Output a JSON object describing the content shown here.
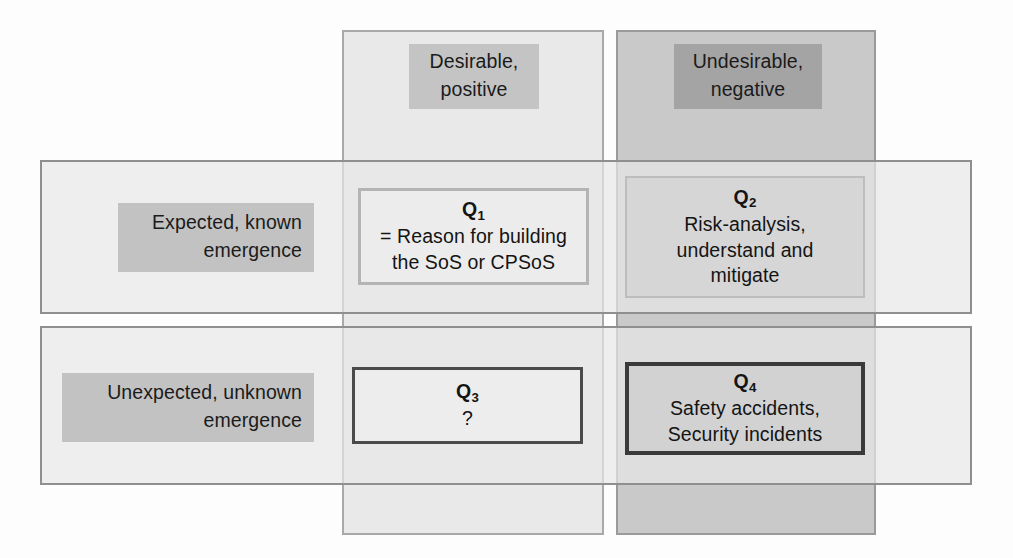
{
  "diagram": {
    "columns": [
      {
        "id": "positive",
        "line1": "Desirable,",
        "line2": "positive"
      },
      {
        "id": "negative",
        "line1": "Undesirable,",
        "line2": "negative"
      }
    ],
    "rows": [
      {
        "id": "expected",
        "line1": "Expected, known",
        "line2": "emergence"
      },
      {
        "id": "unexpected",
        "line1": "Unexpected, unknown",
        "line2": "emergence"
      }
    ],
    "quadrants": [
      {
        "id": "q1",
        "label": "Q",
        "index": "1",
        "lines": [
          "= Reason for building",
          "the SoS or CPSoS"
        ]
      },
      {
        "id": "q2",
        "label": "Q",
        "index": "2",
        "lines": [
          "Risk-analysis,",
          "understand and",
          "mitigate"
        ]
      },
      {
        "id": "q3",
        "label": "Q",
        "index": "3",
        "lines": [
          "?"
        ]
      },
      {
        "id": "q4",
        "label": "Q",
        "index": "4",
        "lines": [
          "Safety accidents,",
          "Security incidents"
        ]
      }
    ],
    "colors": {
      "background": "#fdfdfd",
      "positive_band": "#e2e2e2",
      "negative_band": "#aaaaaa",
      "row_band": "#e7e7e7",
      "label_highlight": "#bebebe",
      "text": "#141414",
      "q3_border": "#4a4a4a",
      "q4_border": "#3a3a3a"
    }
  }
}
